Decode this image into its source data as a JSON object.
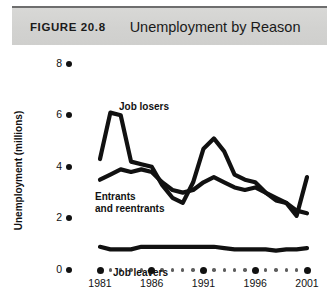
{
  "header": {
    "figure_number": "FIGURE  20.8",
    "title": "Unemployment by Reason",
    "band_color": "#d4d4d2",
    "rule_color": "#6e6e6e"
  },
  "axes": {
    "ylabel": "Unemployment (millions)",
    "yticks": [
      "0",
      "2",
      "4",
      "6",
      "8"
    ],
    "xticks_major": [
      "1981",
      "1986",
      "1991",
      "1996",
      "2001"
    ]
  },
  "series_labels": {
    "job_losers": "Job losers",
    "entrants_line1": "Entrants",
    "entrants_line2": "and reentrants",
    "job_leavers": "Job leavers"
  },
  "chart_data": {
    "type": "line",
    "title": "Unemployment by Reason",
    "xlabel": "",
    "ylabel": "Unemployment (millions)",
    "xlim": [
      1981,
      2001
    ],
    "ylim": [
      0,
      8
    ],
    "yticks": [
      0,
      2,
      4,
      6,
      8
    ],
    "xticks": [
      1981,
      1986,
      1991,
      1996,
      2001
    ],
    "grid": false,
    "legend": "inline-annotations",
    "line_color": "#111111",
    "line_width_px": 4.2,
    "x": [
      1981,
      1982,
      1983,
      1984,
      1985,
      1986,
      1987,
      1988,
      1989,
      1990,
      1991,
      1992,
      1993,
      1994,
      1995,
      1996,
      1997,
      1998,
      1999,
      2000,
      2001
    ],
    "series": [
      {
        "name": "Job losers",
        "values": [
          4.3,
          6.1,
          6.0,
          4.2,
          4.1,
          4.0,
          3.3,
          2.8,
          2.6,
          3.4,
          4.7,
          5.1,
          4.6,
          3.7,
          3.5,
          3.4,
          3.0,
          2.8,
          2.6,
          2.1,
          3.6
        ]
      },
      {
        "name": "Entrants and reentrants",
        "values": [
          3.5,
          3.7,
          3.9,
          3.8,
          3.9,
          3.8,
          3.4,
          3.1,
          3.0,
          3.1,
          3.4,
          3.6,
          3.4,
          3.2,
          3.1,
          3.2,
          3.0,
          2.7,
          2.6,
          2.3,
          2.2
        ]
      },
      {
        "name": "Job leavers",
        "values": [
          0.9,
          0.8,
          0.8,
          0.8,
          0.9,
          0.9,
          0.9,
          0.9,
          0.9,
          0.9,
          0.9,
          0.9,
          0.85,
          0.8,
          0.8,
          0.8,
          0.8,
          0.75,
          0.8,
          0.8,
          0.85
        ]
      }
    ]
  }
}
